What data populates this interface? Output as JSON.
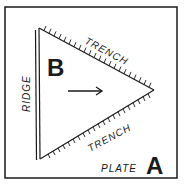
{
  "diagram": {
    "type": "plate-boundary",
    "labels": {
      "ridge": "RIDGE",
      "trench_top": "TRENCH",
      "trench_bottom": "TRENCH",
      "plate_b": "B",
      "plate_a_word": "PLATE",
      "plate_a_letter": "A"
    },
    "colors": {
      "ink": "#1a1a1a",
      "background": "#ffffff"
    }
  }
}
